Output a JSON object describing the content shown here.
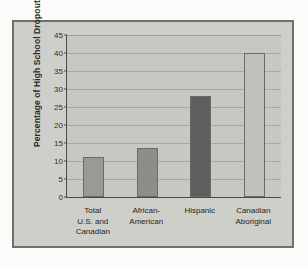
{
  "figure": {
    "frame_border_color": "#6f6f6c",
    "panel_color": "#cfcfc9",
    "plot_color": "#c8c8c2"
  },
  "chart_data": {
    "type": "bar",
    "title": "",
    "xlabel": "",
    "ylabel": "Percentage of High School Dropouts",
    "ylim": [
      0,
      45
    ],
    "yticks": [
      0,
      5,
      10,
      15,
      20,
      25,
      30,
      35,
      40,
      45
    ],
    "ytick_labels": [
      "0",
      "5",
      "10",
      "15",
      "20",
      "25",
      "30",
      "35",
      "40",
      "45"
    ],
    "grid": true,
    "legend": "none",
    "categories": [
      "Total\nU.S. and\nCanadian",
      "African-\nAmerican",
      "Hispanic",
      "Canadian\nAboriginal"
    ],
    "values": [
      11,
      13.5,
      28,
      40
    ],
    "bar_colors": [
      "#9a9a95",
      "#8e8e89",
      "#5e5e5c",
      "#c2c2bc"
    ]
  }
}
